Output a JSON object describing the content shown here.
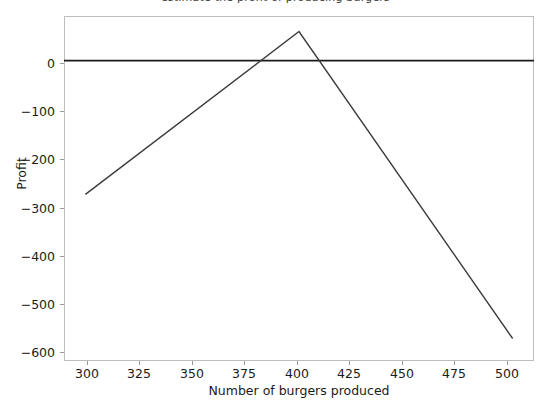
{
  "figure": {
    "background_color": "#ffffff",
    "clipped_caption": "estimate the profit of producing burgers"
  },
  "chart_data": {
    "type": "line",
    "title": "",
    "xlabel": "Number of burgers produced",
    "ylabel": "Profit",
    "xlim": [
      290,
      510
    ],
    "ylim": [
      -640,
      95
    ],
    "xticks": [
      300,
      325,
      350,
      375,
      400,
      425,
      450,
      475,
      500
    ],
    "xticklabels": [
      "300",
      "325",
      "350",
      "375",
      "400",
      "425",
      "450",
      "475",
      "500"
    ],
    "yticks": [
      0,
      -100,
      -200,
      -300,
      -400,
      -500,
      -600
    ],
    "yticklabels": [
      "0",
      "−100",
      "−200",
      "−300",
      "−400",
      "−500",
      "−600"
    ],
    "grid": false,
    "legend": null,
    "series": [
      {
        "name": "profit",
        "color": "#3b3b3b",
        "linewidth": 1.4,
        "x": [
          300,
          400,
          500
        ],
        "values": [
          -285,
          62,
          -592
        ]
      },
      {
        "name": "zero-reference-line",
        "color": "#1b1b1b",
        "linewidth": 1.8,
        "x": [
          290,
          510
        ],
        "values": [
          0,
          0
        ]
      }
    ],
    "annotations": [
      "Piecewise-linear profit curve peaking at 400 burgers (profit ≈ 62).",
      "Break-even crossings near 383 and 410 burgers."
    ]
  },
  "axis_ticks": {
    "x": [
      {
        "label": "300",
        "left_px": 87
      },
      {
        "label": "325",
        "left_px": 139
      },
      {
        "label": "350",
        "left_px": 192
      },
      {
        "label": "375",
        "left_px": 244
      },
      {
        "label": "400",
        "left_px": 297
      },
      {
        "label": "425",
        "left_px": 349
      },
      {
        "label": "450",
        "left_px": 402
      },
      {
        "label": "475",
        "left_px": 454
      },
      {
        "label": "500",
        "left_px": 507
      }
    ],
    "y": [
      {
        "label": "0",
        "top_px": 63
      },
      {
        "label": "−100",
        "top_px": 111
      },
      {
        "label": "−200",
        "top_px": 159
      },
      {
        "label": "−300",
        "top_px": 208
      },
      {
        "label": "−400",
        "top_px": 256
      },
      {
        "label": "−500",
        "top_px": 304
      },
      {
        "label": "−600",
        "top_px": 352
      }
    ]
  }
}
